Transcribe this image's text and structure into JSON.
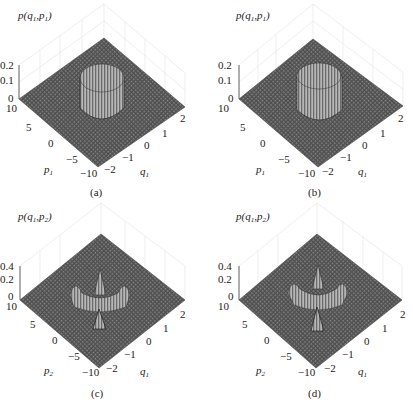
{
  "figure": {
    "panels": [
      {
        "id": "a",
        "caption": "(a)",
        "zlabel": "p(q1,p1)",
        "zlabel_parts": {
          "f": "p(",
          "a": "q",
          "as": "1",
          ",": ",",
          "b": "p",
          "bs": "1",
          "close": ")"
        },
        "zticks": [
          "0.2",
          "0.1",
          "0"
        ],
        "p_label": "p",
        "p_sub": "1",
        "q_label": "q",
        "q_sub": "1",
        "p_ticks": [
          "10",
          "5",
          "0",
          "−5",
          "−10"
        ],
        "q_ticks": [
          "2",
          "1",
          "0",
          "−1",
          "−2"
        ]
      },
      {
        "id": "b",
        "caption": "(b)",
        "zlabel": "p(q1,p1)",
        "zlabel_parts": {
          "f": "p(",
          "a": "q",
          "as": "1",
          ",": ",",
          "b": "p",
          "bs": "1",
          "close": ")"
        },
        "zticks": [
          "0.2",
          "0.1",
          "0"
        ],
        "p_label": "p",
        "p_sub": "1",
        "q_label": "q",
        "q_sub": "1",
        "p_ticks": [
          "10",
          "5",
          "0",
          "−5",
          "−10"
        ],
        "q_ticks": [
          "2",
          "1",
          "0",
          "−1",
          "−2"
        ]
      },
      {
        "id": "c",
        "caption": "(c)",
        "zlabel": "p(q1,p2)",
        "zlabel_parts": {
          "f": "p(",
          "a": "q",
          "as": "1",
          ",": ",",
          "b": "p",
          "bs": "2",
          "close": ")"
        },
        "zticks": [
          "0.4",
          "0.2",
          "0"
        ],
        "p_label": "p",
        "p_sub": "2",
        "q_label": "q",
        "q_sub": "1",
        "p_ticks": [
          "10",
          "5",
          "0",
          "−5",
          "−10"
        ],
        "q_ticks": [
          "2",
          "1",
          "0",
          "−1",
          "−2"
        ]
      },
      {
        "id": "d",
        "caption": "(d)",
        "zlabel": "p(q1,p2)",
        "zlabel_parts": {
          "f": "p(",
          "a": "q",
          "as": "1",
          ",": ",",
          "b": "p",
          "bs": "2",
          "close": ")"
        },
        "zticks": [
          "0.4",
          "0.2",
          "0"
        ],
        "p_label": "p",
        "p_sub": "2",
        "q_label": "q",
        "q_sub": "1",
        "p_ticks": [
          "10",
          "5",
          "0",
          "−5",
          "−10"
        ],
        "q_ticks": [
          "2",
          "1",
          "0",
          "−1",
          "−2"
        ]
      }
    ]
  },
  "colors": {
    "surface": "#5a5a5a",
    "mesh": "#8a8a8a",
    "peak": "#cfcfcf",
    "grid": "#dddddd",
    "text": "#222222"
  }
}
